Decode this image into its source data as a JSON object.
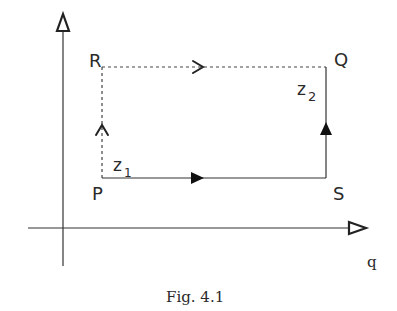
{
  "figure": {
    "caption": "Fig. 4.1",
    "axes": {
      "vertical_label": "",
      "horizontal_label": "q",
      "vertical_arrow": "hollow-triangle-icon",
      "horizontal_arrow": "hollow-triangle-icon"
    },
    "points": {
      "P": "P",
      "Q": "Q",
      "R": "R",
      "S": "S"
    },
    "labels": {
      "z1_base": "z",
      "z1_sub": "1",
      "z2_base": "z",
      "z2_sub": "2"
    },
    "paths": [
      {
        "from": "P",
        "to": "S",
        "style": "solid",
        "arrow": "filled-triangle"
      },
      {
        "from": "S",
        "to": "Q",
        "style": "solid",
        "arrow": "filled-triangle"
      },
      {
        "from": "P",
        "to": "R",
        "style": "dashed",
        "arrow": "open-chevron"
      },
      {
        "from": "R",
        "to": "Q",
        "style": "dashed",
        "arrow": "open-chevron"
      }
    ]
  }
}
